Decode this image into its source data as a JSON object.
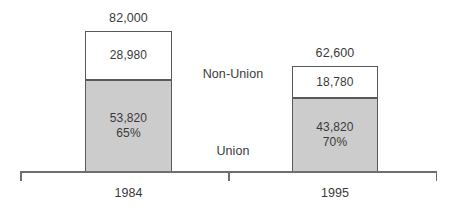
{
  "chart_data": {
    "type": "bar",
    "subtype": "stacked",
    "title": "",
    "xlabel": "",
    "ylabel": "",
    "grid": false,
    "legend_position": "inline-center",
    "axis": {
      "ticks": [
        "left-end",
        "center",
        "right-end"
      ],
      "baseline_only": true
    },
    "categories": [
      "1984",
      "1995"
    ],
    "totals": [
      "82,000",
      "62,600"
    ],
    "totals_numeric": [
      82000,
      62600
    ],
    "series": [
      {
        "name": "Non-Union",
        "values": [
          28980,
          18780
        ],
        "labels": [
          "28,980",
          "18,780"
        ],
        "percent_labels": [
          "",
          ""
        ],
        "color": "#ffffff"
      },
      {
        "name": "Union",
        "values": [
          53820,
          43820
        ],
        "labels": [
          "53,820",
          "43,820"
        ],
        "percent_labels": [
          "65%",
          "70%"
        ],
        "color": "#cccccc"
      }
    ],
    "colors": {
      "union_fill": "#cccccc",
      "nonunion_fill": "#ffffff",
      "bar_border": "#595959",
      "axis": "#6e6e6e",
      "text": "#3a3a3a",
      "background": "#ffffff"
    }
  },
  "bars": [
    {
      "category": "1984",
      "total": "82,000",
      "nonunion": {
        "value": "28,980",
        "percent": ""
      },
      "union": {
        "value": "53,820",
        "percent": "65%"
      }
    },
    {
      "category": "1995",
      "total": "62,600",
      "nonunion": {
        "value": "18,780",
        "percent": ""
      },
      "union": {
        "value": "43,820",
        "percent": "70%"
      }
    }
  ],
  "series_labels": {
    "nonunion": "Non-Union",
    "union": "Union"
  }
}
